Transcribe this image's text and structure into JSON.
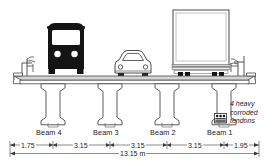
{
  "diagram": {
    "units": "m",
    "total_span_label": "13.15 m",
    "total_span_value": 13.15,
    "beams": [
      {
        "id": "beam-4",
        "label": "Beam 4"
      },
      {
        "id": "beam-3",
        "label": "Beam 3"
      },
      {
        "id": "beam-2",
        "label": "Beam 2"
      },
      {
        "id": "beam-1",
        "label": "Beam 1"
      }
    ],
    "dimensions": [
      {
        "id": "dim-left-overhang",
        "label": "1.75",
        "value": 1.75
      },
      {
        "id": "dim-beam4-beam3",
        "label": "3.15",
        "value": 3.15
      },
      {
        "id": "dim-beam3-beam2",
        "label": "3.15",
        "value": 3.15
      },
      {
        "id": "dim-beam2-beam1",
        "label": "3.15",
        "value": 3.15
      },
      {
        "id": "dim-right-overhang",
        "label": "1.95",
        "value": 1.95
      }
    ],
    "annotation": {
      "line1": "4 heavy",
      "line2": "corroded",
      "line3": "tendons"
    },
    "vehicles": [
      {
        "id": "bus",
        "name": "bus-silhouette"
      },
      {
        "id": "car",
        "name": "car-outline"
      },
      {
        "id": "truck",
        "name": "truck-box-trailer"
      }
    ],
    "colors": {
      "ink": "#1a1a1a",
      "line": "#555555",
      "fill_light": "#f2f2f2",
      "deck_shade": "#d0d0d0",
      "solid": "#111111"
    }
  }
}
